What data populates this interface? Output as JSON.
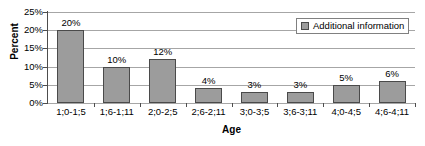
{
  "chart_data": {
    "type": "bar",
    "title": "",
    "xlabel": "Age",
    "ylabel": "Percent",
    "categories": [
      "1;0-1;5",
      "1;6-1;11",
      "2;0-2;5",
      "2;6-2;11",
      "3;0-3;5",
      "3;6-3;11",
      "4;0-4;5",
      "4;6-4;11"
    ],
    "values": [
      20,
      10,
      12,
      4,
      3,
      3,
      5,
      6
    ],
    "value_labels": [
      "20%",
      "10%",
      "12%",
      "4%",
      "3%",
      "3%",
      "5%",
      "6%"
    ],
    "ylim": [
      0,
      25
    ],
    "ytick_labels": [
      "0%",
      "5%",
      "10%",
      "15%",
      "20%",
      "25%"
    ],
    "ytick_values": [
      0,
      5,
      10,
      15,
      20,
      25
    ],
    "grid": true,
    "legend": {
      "position": "top-right",
      "entries": [
        {
          "label": "Additional information",
          "color": "#9c9c9c"
        }
      ]
    },
    "series": [
      {
        "name": "Additional information",
        "color": "#9c9c9c",
        "border_color": "#4a4a4a",
        "values": [
          20,
          10,
          12,
          4,
          3,
          3,
          5,
          6
        ]
      }
    ],
    "colors": {
      "bar_fill": "#9c9c9c",
      "bar_border": "#4a4a4a",
      "gridline": "#a6a6a6",
      "axis": "#4d4d4d",
      "background": "#ffffff",
      "text": "#000000"
    }
  }
}
